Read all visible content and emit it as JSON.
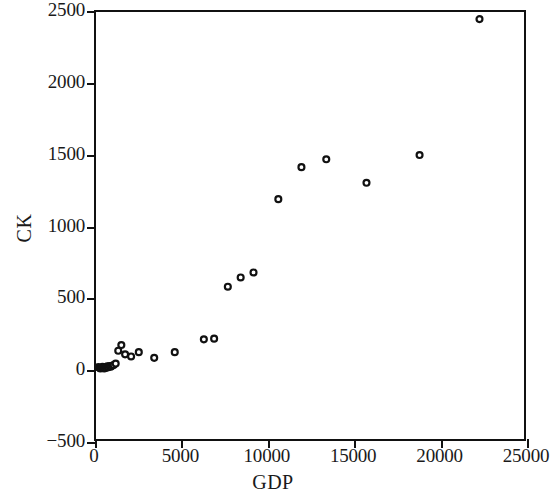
{
  "chart_data": {
    "type": "scatter",
    "title": "",
    "xlabel": "GDP",
    "ylabel": "CK",
    "xlim": [
      0,
      25000
    ],
    "ylim": [
      -500,
      2500
    ],
    "grid": false,
    "legend": null,
    "marker": {
      "shape": "circle",
      "filled": false,
      "edge_color": "#111111",
      "face_color": "#ffffff",
      "size_px": 6
    },
    "xticks": [
      0,
      5000,
      10000,
      15000,
      20000,
      25000
    ],
    "xtick_labels": [
      "0",
      "5000",
      "10000",
      "15000",
      "20000",
      "25000"
    ],
    "yticks": [
      -500,
      0,
      500,
      1000,
      1500,
      2000,
      2500
    ],
    "ytick_labels": [
      "-500",
      "0",
      "500",
      "1000",
      "1500",
      "2000",
      "2500"
    ],
    "series": [
      {
        "name": "observations",
        "x": [
          120,
          200,
          260,
          320,
          380,
          430,
          480,
          540,
          600,
          660,
          720,
          790,
          860,
          940,
          1030,
          1150,
          1300,
          1480,
          1700,
          2050,
          2500,
          3400,
          4600,
          6300,
          6900,
          7700,
          8450,
          9200,
          10650,
          12000,
          13450,
          15800,
          18900,
          22400
        ],
        "y": [
          5,
          0,
          -5,
          0,
          8,
          2,
          -4,
          6,
          0,
          10,
          4,
          12,
          8,
          15,
          20,
          30,
          120,
          160,
          95,
          80,
          110,
          70,
          110,
          200,
          205,
          570,
          635,
          670,
          1185,
          1410,
          1465,
          1300,
          1495,
          2450
        ]
      }
    ]
  },
  "axes": {
    "x_title": "GDP",
    "y_title": "CK"
  }
}
